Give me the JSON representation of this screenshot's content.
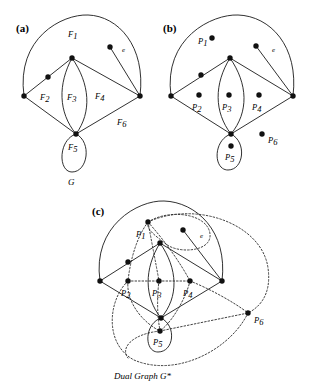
{
  "figure": {
    "title_caption": "Dual Graph G*",
    "graph_name": "G",
    "panels": [
      {
        "id": "a",
        "label": "(a)"
      },
      {
        "id": "b",
        "label": "(b)"
      },
      {
        "id": "c",
        "label": "(c)"
      }
    ],
    "edge_label": "e",
    "colors": {
      "ink": "#1a1a1a",
      "dual_ink": "#2b2b2b",
      "vertex": "#111111",
      "background": "#ffffff"
    }
  },
  "panel_a": {
    "label": "(a)",
    "graph_name": "G",
    "edge_label": "e",
    "face_labels": [
      {
        "base": "F",
        "sub": "1",
        "x": 72,
        "y": 37
      },
      {
        "base": "F",
        "sub": "2",
        "x": 43,
        "y": 97
      },
      {
        "base": "F",
        "sub": "3",
        "x": 70,
        "y": 97
      },
      {
        "base": "F",
        "sub": "4",
        "x": 97,
        "y": 96
      },
      {
        "base": "F",
        "sub": "5",
        "x": 71,
        "y": 148
      },
      {
        "base": "F",
        "sub": "6",
        "x": 120,
        "y": 122
      }
    ],
    "vertices": [
      {
        "name": "left-vertex",
        "x": 24,
        "y": 96
      },
      {
        "name": "top-vertex",
        "x": 72,
        "y": 58
      },
      {
        "name": "right-vertex",
        "x": 140,
        "y": 96
      },
      {
        "name": "bottom-vertex",
        "x": 76,
        "y": 134
      },
      {
        "name": "degree2-vertex",
        "x": 48,
        "y": 77
      },
      {
        "name": "pendant-vertex",
        "x": 110,
        "y": 47
      }
    ]
  },
  "panel_b": {
    "label": "(b)",
    "edge_label": "e",
    "face_points": [
      {
        "base": "P",
        "sub": "1",
        "px": 212,
        "py": 38,
        "lx": 200,
        "ly": 44
      },
      {
        "base": "P",
        "sub": "2",
        "px": 199,
        "py": 95,
        "lx": 194,
        "ly": 108
      },
      {
        "base": "P",
        "sub": "3",
        "px": 229,
        "py": 95,
        "lx": 224,
        "ly": 108
      },
      {
        "base": "P",
        "sub": "4",
        "px": 259,
        "py": 95,
        "lx": 254,
        "ly": 108
      },
      {
        "base": "P",
        "sub": "5",
        "px": 231,
        "py": 146,
        "lx": 226,
        "ly": 158
      },
      {
        "base": "P",
        "sub": "6",
        "px": 262,
        "py": 134,
        "lx": 268,
        "ly": 142
      }
    ],
    "vertices": [
      {
        "name": "left-vertex",
        "x": 171,
        "y": 96
      },
      {
        "name": "top-vertex",
        "x": 230,
        "y": 58
      },
      {
        "name": "right-vertex",
        "x": 293,
        "y": 96
      },
      {
        "name": "bottom-vertex",
        "x": 231,
        "y": 134
      },
      {
        "name": "degree2-vertex",
        "x": 201,
        "y": 75
      },
      {
        "name": "pendant-vertex",
        "x": 256,
        "y": 46
      }
    ]
  },
  "panel_c": {
    "label": "(c)",
    "edge_label": "e",
    "caption": "Dual Graph G*",
    "dual_points": [
      {
        "base": "P",
        "sub": "1",
        "px": 148,
        "py": 222,
        "lx": 137,
        "ly": 235
      },
      {
        "base": "P",
        "sub": "2",
        "px": 128,
        "py": 281,
        "lx": 122,
        "ly": 294
      },
      {
        "base": "P",
        "sub": "3",
        "px": 159,
        "py": 281,
        "lx": 153,
        "ly": 294
      },
      {
        "base": "P",
        "sub": "4",
        "px": 190,
        "py": 281,
        "lx": 184,
        "ly": 294
      },
      {
        "base": "P",
        "sub": "5",
        "px": 160,
        "py": 331,
        "lx": 155,
        "ly": 344
      },
      {
        "base": "P",
        "sub": "6",
        "px": 248,
        "py": 313,
        "lx": 253,
        "ly": 322
      }
    ],
    "vertices": [
      {
        "name": "left-vertex",
        "x": 100,
        "y": 281
      },
      {
        "name": "top-vertex",
        "x": 160,
        "y": 243
      },
      {
        "name": "right-vertex",
        "x": 222,
        "y": 281
      },
      {
        "name": "bottom-vertex",
        "x": 161,
        "y": 318
      },
      {
        "name": "degree2-vertex",
        "x": 128,
        "y": 262
      },
      {
        "name": "pendant-vertex",
        "x": 183,
        "y": 230
      }
    ]
  }
}
